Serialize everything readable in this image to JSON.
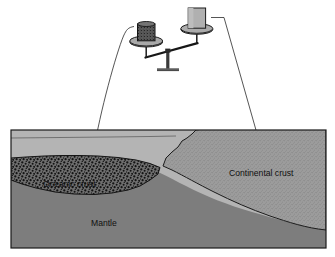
{
  "figure": {
    "type": "geologic cross-section with balance scale"
  },
  "labels": {
    "oceanic_crust": "Oceanic crust",
    "continental_crust": "Continental crust",
    "mantle": "Mantle"
  },
  "balance": {
    "left_weight_name": "oceanic-crust-sample-weight",
    "right_weight_name": "continental-crust-sample-weight",
    "left_side_state": "down",
    "right_side_state": "up",
    "stand_name": "balance-fulcrum-stand"
  },
  "pointers": {
    "left_leader_name": "oceanic-crust-leader-arrow",
    "right_leader_name": "continental-crust-leader-arrow"
  },
  "colors": {
    "water": "#b4b4b4",
    "mantle": "#7d7d7d",
    "continental_crust": "#9c9c9c",
    "oceanic_crust": "#6d6d6d",
    "oceanic_speckle": "#161616",
    "continental_speckle": "#6f6f6f",
    "outline": "#1a1a1a",
    "weight_light": "#a8a8a8",
    "weight_dark": "#5f5f5f",
    "pan": "#8e8e8e",
    "background": "#ffffff",
    "label_text": "#101010"
  },
  "frame": {
    "x": 11,
    "y": 130,
    "width": 315,
    "height": 118
  }
}
